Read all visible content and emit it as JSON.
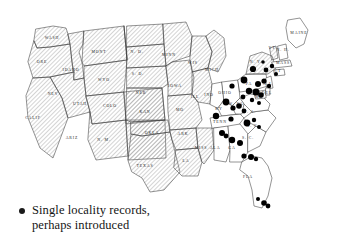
{
  "figure": {
    "type": "distribution-map",
    "region": "Contiguous United States",
    "background_color": "#ffffff",
    "outline_color": "#3b3b3b",
    "hatch_color": "#9a9a9a",
    "dot_color": "#000000"
  },
  "legend": {
    "symbol": "filled-circle",
    "dot_color": "#000000",
    "text": "Single locality records,\nperhaps introduced",
    "line1": "Single locality records,",
    "line2": "perhaps introduced"
  },
  "map": {
    "shading_key": {
      "hatched": "main distribution range",
      "plain": "outside main range"
    },
    "states": [
      {
        "abbr": "WASH",
        "label": "WASH",
        "shading": "hatched",
        "lx": 52,
        "ly": 38
      },
      {
        "abbr": "ORE",
        "label": "ORE",
        "shading": "hatched",
        "lx": 42,
        "ly": 62
      },
      {
        "abbr": "IDAHO",
        "label": "IDAHO",
        "shading": "hatched",
        "lx": 71,
        "ly": 70
      },
      {
        "abbr": "MONT",
        "label": "MONT",
        "shading": "hatched",
        "lx": 99,
        "ly": 52
      },
      {
        "abbr": "WYO",
        "label": "WYO",
        "shading": "hatched",
        "lx": 104,
        "ly": 80
      },
      {
        "abbr": "NEV",
        "label": "NEV",
        "shading": "hatched",
        "lx": 53,
        "ly": 94
      },
      {
        "abbr": "UTAH",
        "label": "UTAH",
        "shading": "hatched",
        "lx": 80,
        "ly": 104
      },
      {
        "abbr": "COLO",
        "label": "COLO",
        "shading": "hatched",
        "lx": 110,
        "ly": 106
      },
      {
        "abbr": "CALIF",
        "label": "CALIF",
        "shading": "hatched",
        "lx": 33,
        "ly": 118
      },
      {
        "abbr": "ARIZ",
        "label": "ARIZ",
        "shading": "hatched",
        "lx": 72,
        "ly": 138
      },
      {
        "abbr": "N.M.",
        "label": "N. M.",
        "shading": "hatched",
        "lx": 104,
        "ly": 140
      },
      {
        "abbr": "N.D.",
        "label": "N. D.",
        "shading": "hatched",
        "lx": 137,
        "ly": 52
      },
      {
        "abbr": "S.D.",
        "label": "S. D.",
        "shading": "hatched",
        "lx": 138,
        "ly": 74
      },
      {
        "abbr": "NEB",
        "label": "NEB",
        "shading": "hatched",
        "lx": 141,
        "ly": 93
      },
      {
        "abbr": "KAN",
        "label": "KAN",
        "shading": "hatched",
        "lx": 145,
        "ly": 112
      },
      {
        "abbr": "OKLA",
        "label": "OKLA",
        "shading": "hatched",
        "lx": 152,
        "ly": 133
      },
      {
        "abbr": "TEXAS",
        "label": "TEXAS",
        "shading": "hatched",
        "lx": 145,
        "ly": 166
      },
      {
        "abbr": "MINN",
        "label": "MINN",
        "shading": "hatched",
        "lx": 169,
        "ly": 55
      },
      {
        "abbr": "IOWA",
        "label": "IOWA",
        "shading": "hatched",
        "lx": 175,
        "ly": 86
      },
      {
        "abbr": "MO",
        "label": "MO",
        "shading": "hatched",
        "lx": 180,
        "ly": 110
      },
      {
        "abbr": "ARK",
        "label": "ARK",
        "shading": "hatched",
        "lx": 183,
        "ly": 134
      },
      {
        "abbr": "LA",
        "label": "LA",
        "shading": "hatched",
        "lx": 186,
        "ly": 161
      },
      {
        "abbr": "WIS",
        "label": "WIS",
        "shading": "hatched",
        "lx": 193,
        "ly": 63
      },
      {
        "abbr": "ILL",
        "label": "ILL",
        "shading": "hatched",
        "lx": 195,
        "ly": 97
      },
      {
        "abbr": "MISS",
        "label": "MISS",
        "shading": "hatched",
        "lx": 201,
        "ly": 148
      },
      {
        "abbr": "MICH",
        "label": "MICH",
        "shading": "hatched",
        "lx": 212,
        "ly": 70
      },
      {
        "abbr": "IND",
        "label": "IND",
        "shading": "plain",
        "lx": 209,
        "ly": 95
      },
      {
        "abbr": "OHIO",
        "label": "OHIO",
        "shading": "plain",
        "lx": 225,
        "ly": 93
      },
      {
        "abbr": "KY",
        "label": "KY",
        "shading": "plain",
        "lx": 219,
        "ly": 109
      },
      {
        "abbr": "TENN",
        "label": "TENN",
        "shading": "plain",
        "lx": 220,
        "ly": 122
      },
      {
        "abbr": "ALA",
        "label": "ALA",
        "shading": "plain",
        "lx": 215,
        "ly": 148
      },
      {
        "abbr": "GA",
        "label": "GA",
        "shading": "plain",
        "lx": 232,
        "ly": 148
      },
      {
        "abbr": "FLA",
        "label": "FLA",
        "shading": "plain",
        "lx": 248,
        "ly": 177
      },
      {
        "abbr": "S.C.",
        "label": "S. C.",
        "shading": "plain",
        "lx": 248,
        "ly": 138
      },
      {
        "abbr": "N.C.",
        "label": "N. C.",
        "shading": "plain",
        "lx": 253,
        "ly": 126
      },
      {
        "abbr": "VA",
        "label": "V. A.",
        "shading": "plain",
        "lx": 250,
        "ly": 112
      },
      {
        "abbr": "W.VA",
        "label": "W. VA",
        "shading": "plain",
        "lx": 236,
        "ly": 104
      },
      {
        "abbr": "PA",
        "label": "PA",
        "shading": "plain",
        "lx": 249,
        "ly": 84
      },
      {
        "abbr": "N.Y.",
        "label": "N. Y.",
        "shading": "hatched",
        "lx": 256,
        "ly": 62
      },
      {
        "abbr": "MAINE",
        "label": "MAINE",
        "shading": "plain",
        "lx": 299,
        "ly": 33
      },
      {
        "abbr": "VT",
        "label": "VT",
        "shading": "hatched",
        "lx": 272,
        "ly": 48
      },
      {
        "abbr": "N.H.",
        "label": "N. H.",
        "shading": "plain",
        "lx": 283,
        "ly": 50
      },
      {
        "abbr": "MASS",
        "label": "MASS",
        "shading": "plain",
        "lx": 283,
        "ly": 63
      },
      {
        "abbr": "CONN",
        "label": "CT",
        "shading": "plain",
        "lx": 278,
        "ly": 71
      },
      {
        "abbr": "N.J.",
        "label": "N.J.",
        "shading": "plain",
        "lx": 268,
        "ly": 84
      },
      {
        "abbr": "MD",
        "label": "MD",
        "shading": "plain",
        "lx": 259,
        "ly": 97
      },
      {
        "abbr": "DEL",
        "label": "DEL",
        "shading": "plain",
        "lx": 267,
        "ly": 93
      }
    ],
    "occurrence_dots": [
      {
        "x": 253,
        "y": 69,
        "r": 3.1
      },
      {
        "x": 266,
        "y": 70,
        "r": 2.4
      },
      {
        "x": 272,
        "y": 66,
        "r": 2.2
      },
      {
        "x": 263,
        "y": 62,
        "r": 1.8
      },
      {
        "x": 276,
        "y": 74,
        "r": 2.0
      },
      {
        "x": 244,
        "y": 80,
        "r": 3.4
      },
      {
        "x": 258,
        "y": 84,
        "r": 3.0
      },
      {
        "x": 264,
        "y": 81,
        "r": 2.6
      },
      {
        "x": 269,
        "y": 86,
        "r": 2.2
      },
      {
        "x": 232,
        "y": 86,
        "r": 2.6
      },
      {
        "x": 249,
        "y": 91,
        "r": 3.2
      },
      {
        "x": 256,
        "y": 92,
        "r": 3.6
      },
      {
        "x": 261,
        "y": 95,
        "r": 2.8
      },
      {
        "x": 243,
        "y": 97,
        "r": 2.4
      },
      {
        "x": 252,
        "y": 100,
        "r": 2.2
      },
      {
        "x": 259,
        "y": 103,
        "r": 2.0
      },
      {
        "x": 226,
        "y": 102,
        "r": 3.4
      },
      {
        "x": 233,
        "y": 108,
        "r": 2.6
      },
      {
        "x": 239,
        "y": 106,
        "r": 2.8
      },
      {
        "x": 244,
        "y": 111,
        "r": 2.4
      },
      {
        "x": 216,
        "y": 116,
        "r": 3.2
      },
      {
        "x": 231,
        "y": 119,
        "r": 2.6
      },
      {
        "x": 247,
        "y": 123,
        "r": 3.4
      },
      {
        "x": 254,
        "y": 120,
        "r": 2.2
      },
      {
        "x": 259,
        "y": 127,
        "r": 2.0
      },
      {
        "x": 222,
        "y": 133,
        "r": 3.0
      },
      {
        "x": 226,
        "y": 136,
        "r": 2.4
      },
      {
        "x": 232,
        "y": 140,
        "r": 3.2
      },
      {
        "x": 240,
        "y": 143,
        "r": 3.0
      },
      {
        "x": 244,
        "y": 156,
        "r": 2.6
      },
      {
        "x": 251,
        "y": 157,
        "r": 3.0
      },
      {
        "x": 256,
        "y": 159,
        "r": 2.2
      },
      {
        "x": 264,
        "y": 203,
        "r": 2.8
      },
      {
        "x": 268,
        "y": 206,
        "r": 2.4
      },
      {
        "x": 258,
        "y": 199,
        "r": 2.0
      }
    ]
  }
}
